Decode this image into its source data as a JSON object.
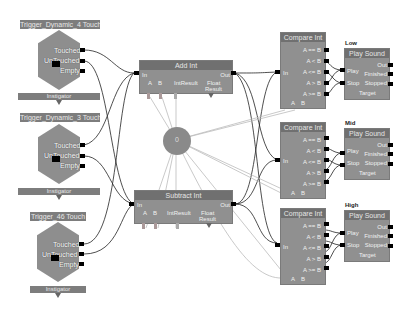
{
  "triggers": [
    {
      "title": "Trigger_Dynamic_4 Touch",
      "ports": [
        "Touched",
        "UnTouched",
        "Empty"
      ],
      "instigator": "Instigator"
    },
    {
      "title": "Trigger_Dynamic_3 Touch",
      "ports": [
        "Touched",
        "UnTouched",
        "Empty"
      ],
      "instigator": "Instigator"
    },
    {
      "title": "Trigger_46 Touch",
      "ports": [
        "Touched",
        "UnTouched",
        "Empty"
      ],
      "instigator": "Instigator"
    }
  ],
  "math_nodes": [
    {
      "title": "Add Int",
      "in": "In",
      "out": "Out",
      "vars": [
        "A",
        "B",
        "IntResult",
        "Float",
        "Result"
      ]
    },
    {
      "title": "Subtract Int",
      "in": "In",
      "out": "Out",
      "vars": [
        "A",
        "B",
        "IntResult",
        "Float",
        "Result"
      ]
    }
  ],
  "variable": {
    "label": "0"
  },
  "compare_nodes": [
    {
      "title": "Compare Int",
      "in": "In",
      "outputs": [
        "A == B",
        "A < B",
        "A <= B",
        "A > B",
        "A >= B"
      ],
      "vars": [
        "A",
        "B"
      ]
    },
    {
      "title": "Compare Int",
      "in": "In",
      "outputs": [
        "A == B",
        "A < B",
        "A <= B",
        "A > B",
        "A >= B"
      ],
      "vars": [
        "A",
        "B"
      ]
    },
    {
      "title": "Compare Int",
      "in": "In",
      "outputs": [
        "A == B",
        "A < B",
        "A <= B",
        "A > B",
        "A >= B"
      ],
      "vars": [
        "A",
        "B"
      ]
    }
  ],
  "sound_nodes": [
    {
      "heading": "Low",
      "title": "Play Sound",
      "inputs": [
        "Play",
        "Stop"
      ],
      "outputs": [
        "Out",
        "Finished",
        "Stopped"
      ],
      "target": "Target"
    },
    {
      "heading": "Mid",
      "title": "Play Sound",
      "inputs": [
        "Play",
        "Stop"
      ],
      "outputs": [
        "Out",
        "Finished",
        "Stopped"
      ],
      "target": "Target"
    },
    {
      "heading": "High",
      "title": "Play Sound",
      "inputs": [
        "Play",
        "Stop"
      ],
      "outputs": [
        "Out",
        "Finished",
        "Stopped"
      ],
      "target": "Target"
    }
  ],
  "colors": {
    "node": "#909090",
    "title_bar": "#707070",
    "wire": "#222222",
    "var_wire": "#bbbbbb",
    "background": "#ffffff"
  }
}
